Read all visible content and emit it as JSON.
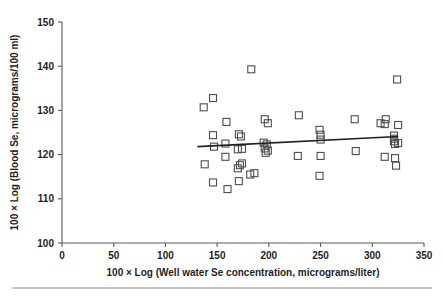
{
  "figure": {
    "background": "#ffffff",
    "marker_color": "#4d4d4f",
    "axis_color": "#58595b",
    "line_color": "#231f20",
    "footer_rule": true
  },
  "chart_data": {
    "type": "scatter",
    "title": "",
    "xlabel": "100 × Log (Well water Se concentration, micrograms/liter)",
    "ylabel": "100 × Log (Blood Se, micrograms/100 ml)",
    "xlim": [
      0,
      350
    ],
    "ylim": [
      100,
      150
    ],
    "xticks": [
      0,
      50,
      100,
      150,
      200,
      250,
      300,
      350
    ],
    "yticks": [
      100,
      110,
      120,
      130,
      140,
      150
    ],
    "xtick_labels": [
      "0",
      "50",
      "100",
      "150",
      "200",
      "250",
      "300",
      "350"
    ],
    "ytick_labels": [
      "100",
      "110",
      "120",
      "130",
      "140",
      "150"
    ],
    "grid": false,
    "legend": null,
    "marker_style": "open-square",
    "points": [
      [
        137,
        130.7
      ],
      [
        146,
        132.8
      ],
      [
        138,
        117.8
      ],
      [
        146,
        124.4
      ],
      [
        147,
        121.8
      ],
      [
        146,
        113.7
      ],
      [
        159,
        127.4
      ],
      [
        158,
        122.5
      ],
      [
        158,
        119.5
      ],
      [
        160,
        112.2
      ],
      [
        171,
        124.6
      ],
      [
        173,
        124.1
      ],
      [
        170,
        121.2
      ],
      [
        174,
        121.3
      ],
      [
        172,
        117.6
      ],
      [
        174,
        118.0
      ],
      [
        170,
        116.9
      ],
      [
        171,
        114.0
      ],
      [
        183,
        139.3
      ],
      [
        182,
        115.5
      ],
      [
        186,
        115.8
      ],
      [
        196,
        128.0
      ],
      [
        199,
        127.1
      ],
      [
        195,
        122.7
      ],
      [
        198,
        122.3
      ],
      [
        196,
        121.4
      ],
      [
        199,
        120.9
      ],
      [
        197,
        120.4
      ],
      [
        229,
        128.9
      ],
      [
        228,
        119.7
      ],
      [
        249,
        125.6
      ],
      [
        250,
        124.5
      ],
      [
        250,
        123.4
      ],
      [
        250,
        119.7
      ],
      [
        249,
        115.2
      ],
      [
        283,
        128.0
      ],
      [
        284,
        120.8
      ],
      [
        308,
        127.1
      ],
      [
        313,
        128.0
      ],
      [
        312,
        126.9
      ],
      [
        321,
        124.3
      ],
      [
        321,
        123.6
      ],
      [
        321,
        123.0
      ],
      [
        322,
        122.4
      ],
      [
        325,
        126.7
      ],
      [
        325,
        122.6
      ],
      [
        312,
        119.5
      ],
      [
        322,
        119.2
      ],
      [
        324,
        137.0
      ],
      [
        323,
        117.5
      ]
    ],
    "fit_line": {
      "x_start": 131,
      "y_start": 121.8,
      "x_end": 325,
      "y_end": 124.1
    }
  }
}
